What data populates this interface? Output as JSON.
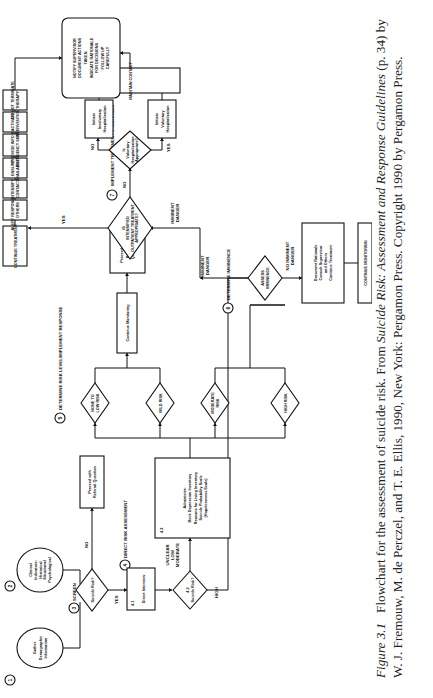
{
  "figure": {
    "steps": {
      "s1": {
        "num": "1",
        "lines": [
          "Gather",
          "Demographic",
          "Information"
        ]
      },
      "s2": {
        "num": "2",
        "lines": [
          "Clinical",
          "Indicators:",
          "Historical",
          "Situational",
          "Psychological"
        ]
      },
      "s3": {
        "num": "3",
        "label": "SCREEN",
        "diamond": "Suicide Risk?",
        "yes": "YES",
        "no": "NO",
        "no_box": [
          "Proceed with",
          "Referral Question"
        ]
      },
      "s4": {
        "num": "4",
        "label": "DIRECT RISK ASSESSMENT",
        "b41": {
          "id": "4.1",
          "text": "Direct Interview"
        },
        "b42": {
          "id": "4.2",
          "text": "Suicide Risk?",
          "low": [
            "UNCLEAR",
            "LOW",
            "MODERATE"
          ],
          "high": "HIGH"
        },
        "b43": {
          "id": "4.3",
          "lines": [
            "Administer:",
            "Beck Depression Inventory",
            "Reasons for Living Inventory",
            "Suicide Probability Scale",
            "(Hopelessness Scale)"
          ]
        }
      },
      "s5": {
        "num": "5",
        "label": "DETERMINE RISK LEVEL/IMPLEMENT RESPONSE",
        "risks": [
          [
            "NONE TO",
            "LOW RISK"
          ],
          [
            "MILD RISK"
          ],
          [
            "MODERATE",
            "RISK"
          ],
          [
            "HIGH RISK"
          ]
        ],
        "monitor": "Continue Monitoring",
        "referral": [
          "Proceed with",
          "Referral",
          "Question"
        ]
      },
      "s6": {
        "num": "6",
        "label": "DETERMINE IMMINENCE",
        "diamond": [
          "ASSESS",
          "IMMINENCE"
        ],
        "imminent": [
          "IMMINENT",
          "DANGER"
        ],
        "not_imminent": [
          "NO IMMINENT",
          "DANGER"
        ],
        "doc_box": [
          "Document Rationale",
          "Consult Supervisor",
          "and Others",
          "Continue Treatment"
        ],
        "continue_monitoring": "CONTINUE MONITORING"
      },
      "s7": {
        "num": "7",
        "label": "IMPLEMENT TREATMENT STRATEGIES",
        "imminent": [
          "IMMINENT",
          "DANGER"
        ],
        "diamond": [
          "IS",
          "INTENSIFIED",
          "OUTPATIENT TREATMENT",
          "APPROPRIATE?"
        ],
        "yes": "YES",
        "no": "NO",
        "vol_diamond": [
          "Is",
          "Voluntary",
          "Hospitalization",
          "Appropriate?"
        ],
        "vol_yes": "YES",
        "vol_no": "NO",
        "vol_box": [
          "Initiate",
          "Voluntary",
          "Hospitalization"
        ],
        "invol_box": [
          "Initiate",
          "Involuntary",
          "Hospitalization"
        ],
        "maintain": "MAINTAIN CONTACT",
        "strategies": [
          [
            "CONTINUE TREATMENT"
          ],
          [
            "ALERT RESPONSIBLE",
            "OTHERS"
          ],
          [
            "INTENSIFY",
            "CONTACT"
          ],
          [
            "ENSURE",
            "AVAILABILITY"
          ],
          [
            "PROVIDE INFO RE:",
            "EMERGENCY SERVICES"
          ],
          [
            "ACTIVATE",
            "INTERVENTIONS"
          ],
          [
            "DO NOT TERMINATE",
            "THERAPY"
          ]
        ],
        "final": [
          "NOTIFY SUPERVISOR",
          "DOCUMENT ACTIONS",
          "TAKEN",
          "INDICATE RATIONALE",
          "FOR DECISIONS",
          "FOLLOW UP",
          "CAREFULLY"
        ]
      }
    }
  },
  "caption": {
    "label": "Figure 3.1",
    "text1": "Flowchart for the assessment of suicide risk. From ",
    "source_title": "Suicide Risk: Assessment and Response Guidelines",
    "text2": " (p. 34) by W. J. Fremouw, M. de Perczel, and T. E. Ellis, 1990, New York: Pergamon Press. Copyright 1990 by Pergamon Press."
  }
}
